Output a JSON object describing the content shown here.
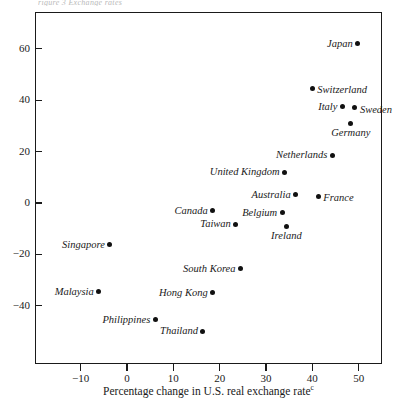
{
  "figure": {
    "top_caption_fragment": "rigure 3  Exchange rates"
  },
  "chart_data": {
    "type": "scatter",
    "title": "",
    "xlabel": "Percentage change in U.S. real exchange rate",
    "xlabel_footnote": "c",
    "ylabel": "",
    "xlim": [
      -18,
      58
    ],
    "ylim": [
      -58,
      72
    ],
    "xticks": [
      -10,
      0,
      10,
      20,
      30,
      40,
      50
    ],
    "xtick_labels": [
      "−10",
      "0",
      "10",
      "20",
      "30",
      "40",
      "50"
    ],
    "yticks": [
      60,
      40,
      20,
      0,
      -20,
      -40
    ],
    "ytick_labels": [
      "60",
      "40",
      "20",
      "0",
      "−20",
      "−40"
    ],
    "grid": false,
    "legend": "none",
    "points": [
      {
        "label": "Japan",
        "x": 49.8,
        "y": 62.0,
        "label_pos": "left"
      },
      {
        "label": "Switzerland",
        "x": 40.0,
        "y": 44.6,
        "label_pos": "right"
      },
      {
        "label": "Italy",
        "x": 46.5,
        "y": 37.5,
        "label_pos": "left"
      },
      {
        "label": "Sweden",
        "x": 49.2,
        "y": 37.0,
        "label_pos": "right"
      },
      {
        "label": "Germany",
        "x": 48.3,
        "y": 31.0,
        "label_pos": "below"
      },
      {
        "label": "Netherlands",
        "x": 44.3,
        "y": 18.5,
        "label_pos": "left"
      },
      {
        "label": "United Kingdom",
        "x": 34.0,
        "y": 12.0,
        "label_pos": "left"
      },
      {
        "label": "Australia",
        "x": 36.4,
        "y": 3.2,
        "label_pos": "left"
      },
      {
        "label": "France",
        "x": 41.3,
        "y": 2.6,
        "label_pos": "right"
      },
      {
        "label": "Canada",
        "x": 18.5,
        "y": -3.0,
        "label_pos": "left"
      },
      {
        "label": "Belgium",
        "x": 33.5,
        "y": -3.8,
        "label_pos": "left"
      },
      {
        "label": "Taiwan",
        "x": 23.5,
        "y": -8.2,
        "label_pos": "left"
      },
      {
        "label": "Ireland",
        "x": 34.4,
        "y": -9.0,
        "label_pos": "below"
      },
      {
        "label": "Singapore",
        "x": -3.7,
        "y": -16.3,
        "label_pos": "left"
      },
      {
        "label": "South Korea",
        "x": 24.5,
        "y": -25.5,
        "label_pos": "left"
      },
      {
        "label": "Malaysia",
        "x": -6.1,
        "y": -34.5,
        "label_pos": "left"
      },
      {
        "label": "Hong Kong",
        "x": 18.5,
        "y": -34.9,
        "label_pos": "left"
      },
      {
        "label": "Philippines",
        "x": 6.1,
        "y": -45.5,
        "label_pos": "left"
      },
      {
        "label": "Thailand",
        "x": 16.4,
        "y": -49.9,
        "label_pos": "left"
      }
    ]
  }
}
